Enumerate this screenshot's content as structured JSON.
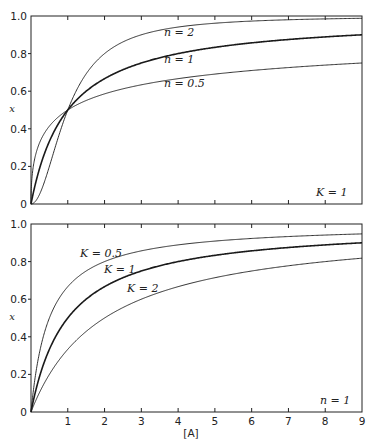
{
  "chart_data": [
    {
      "type": "line",
      "title": "",
      "xlabel": "",
      "ylabel": "x",
      "xlim": [
        0,
        9
      ],
      "ylim": [
        0,
        1.0
      ],
      "xticks": [
        0,
        1,
        2,
        3,
        4,
        5,
        6,
        7,
        8,
        9
      ],
      "xtick_labels_visible": false,
      "yticks": [
        0,
        0.2,
        0.4,
        0.6,
        0.8,
        1.0
      ],
      "ytick_labels": [
        "0",
        "0.2",
        "0.4",
        "0.6",
        "0.8",
        "1.0"
      ],
      "grid": false,
      "formula": "x = [A]^n / (K^n + [A]^n)",
      "annotation": "K = 1",
      "x": [
        0,
        0.25,
        0.5,
        0.75,
        1,
        1.5,
        2,
        3,
        4,
        5,
        6,
        7,
        8,
        9
      ],
      "series": [
        {
          "name": "n = 2",
          "label": "n = 2",
          "values": [
            0,
            0.059,
            0.2,
            0.36,
            0.5,
            0.692,
            0.8,
            0.9,
            0.941,
            0.962,
            0.973,
            0.98,
            0.985,
            0.988
          ],
          "weight": "thin"
        },
        {
          "name": "n = 1",
          "label": "n = 1",
          "values": [
            0,
            0.2,
            0.333,
            0.429,
            0.5,
            0.6,
            0.667,
            0.75,
            0.8,
            0.833,
            0.857,
            0.875,
            0.889,
            0.9
          ],
          "weight": "thick"
        },
        {
          "name": "n = 0.5",
          "label": "n = 0.5",
          "values": [
            0,
            0.333,
            0.414,
            0.464,
            0.5,
            0.551,
            0.586,
            0.634,
            0.667,
            0.691,
            0.71,
            0.726,
            0.739,
            0.75
          ],
          "weight": "thin"
        }
      ]
    },
    {
      "type": "line",
      "title": "",
      "xlabel": "[A]",
      "ylabel": "x",
      "xlim": [
        0,
        9
      ],
      "ylim": [
        0,
        1.0
      ],
      "xticks": [
        0,
        1,
        2,
        3,
        4,
        5,
        6,
        7,
        8,
        9
      ],
      "xtick_labels": [
        "",
        "1",
        "2",
        "3",
        "4",
        "5",
        "6",
        "7",
        "8",
        "9"
      ],
      "yticks": [
        0,
        0.2,
        0.4,
        0.6,
        0.8,
        1.0
      ],
      "ytick_labels": [
        "0",
        "0.2",
        "0.4",
        "0.6",
        "0.8",
        "1.0"
      ],
      "grid": false,
      "formula": "x = [A] / (K + [A])",
      "annotation": "n = 1",
      "x": [
        0,
        0.25,
        0.5,
        0.75,
        1,
        1.5,
        2,
        3,
        4,
        5,
        6,
        7,
        8,
        9
      ],
      "series": [
        {
          "name": "K = 0.5",
          "label": "K = 0.5",
          "values": [
            0,
            0.333,
            0.5,
            0.6,
            0.667,
            0.75,
            0.8,
            0.857,
            0.889,
            0.909,
            0.923,
            0.933,
            0.941,
            0.947
          ],
          "weight": "thin"
        },
        {
          "name": "K = 1",
          "label": "K = 1",
          "values": [
            0,
            0.2,
            0.333,
            0.429,
            0.5,
            0.6,
            0.667,
            0.75,
            0.8,
            0.833,
            0.857,
            0.875,
            0.889,
            0.9
          ],
          "weight": "thick"
        },
        {
          "name": "K = 2",
          "label": "K = 2",
          "values": [
            0,
            0.111,
            0.2,
            0.273,
            0.333,
            0.429,
            0.5,
            0.6,
            0.667,
            0.714,
            0.75,
            0.778,
            0.8,
            0.818
          ],
          "weight": "thin"
        }
      ]
    }
  ],
  "top_plot": {
    "ylabel": "x",
    "yticks": [
      "0",
      "0.2",
      "0.4",
      "0.6",
      "0.8",
      "1.0"
    ],
    "labels": {
      "n2": "n = 2",
      "n1": "n = 1",
      "n05": "n = 0.5"
    },
    "annotation": "K = 1"
  },
  "bottom_plot": {
    "ylabel": "x",
    "xlabel": "[A]",
    "yticks": [
      "0",
      "0.2",
      "0.4",
      "0.6",
      "0.8",
      "1.0"
    ],
    "xticks": [
      "1",
      "2",
      "3",
      "4",
      "5",
      "6",
      "7",
      "8",
      "9"
    ],
    "labels": {
      "k05": "K = 0.5",
      "k1": "K = 1",
      "k2": "K = 2"
    },
    "annotation": "n = 1"
  }
}
